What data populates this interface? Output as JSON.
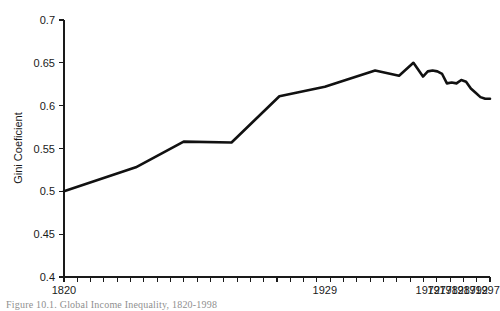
{
  "figure": {
    "caption": "Figure 10.1.  Global Income Inequality, 1820-1998",
    "background_color": "#ffffff",
    "line_color": "#111111",
    "axis_color": "#1a1a1a"
  },
  "chart_data": {
    "type": "line",
    "title": "",
    "xlabel": "",
    "ylabel": "Gini Coeficient",
    "ylim": [
      0.4,
      0.7
    ],
    "xlim": [
      1820,
      1998
    ],
    "grid": false,
    "legend": null,
    "ytick_labels": [
      "0.7",
      "0.65",
      "0.6",
      "0.55",
      "0.5",
      "0.45",
      "0.4"
    ],
    "ytick_values": [
      0.7,
      0.65,
      0.6,
      0.55,
      0.5,
      0.45,
      0.4
    ],
    "xtick_labels": [
      "1820",
      "1929",
      "1972",
      "1977",
      "1982",
      "1987",
      "1992",
      "1997"
    ],
    "xtick_values": [
      1820,
      1929,
      1972,
      1977,
      1982,
      1987,
      1992,
      1997
    ],
    "minor_xticks": 32,
    "series": [
      {
        "name": "Global Gini coefficient",
        "x": [
          1820,
          1850,
          1870,
          1890,
          1910,
          1929,
          1950,
          1960,
          1966,
          1970,
          1972,
          1974,
          1976,
          1978,
          1980,
          1982,
          1984,
          1986,
          1988,
          1990,
          1992,
          1994,
          1996,
          1998
        ],
        "values": [
          0.5,
          0.528,
          0.558,
          0.557,
          0.611,
          0.622,
          0.641,
          0.635,
          0.65,
          0.634,
          0.64,
          0.641,
          0.64,
          0.637,
          0.626,
          0.627,
          0.626,
          0.63,
          0.628,
          0.62,
          0.615,
          0.61,
          0.608,
          0.608
        ]
      }
    ]
  },
  "axis_geometry": {
    "plot_left": 64,
    "plot_right": 490,
    "plot_top": 20,
    "plot_bottom": 277
  }
}
